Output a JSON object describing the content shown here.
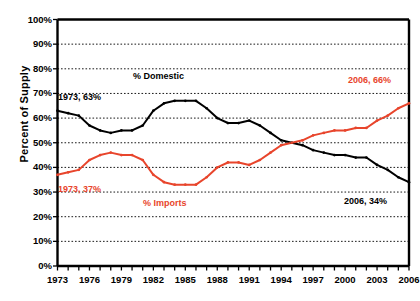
{
  "chart_data": {
    "type": "line",
    "title": "",
    "xlabel": "",
    "ylabel": "Percent of Supply",
    "ylim": [
      0,
      100
    ],
    "xlim": [
      1973,
      2006
    ],
    "grid": true,
    "legend_position": "inline-annotations",
    "ytick_labels": [
      "100%",
      "90%",
      "80%",
      "70%",
      "60%",
      "50%",
      "40%",
      "30%",
      "20%",
      "10%",
      "0%"
    ],
    "ytick_values": [
      100,
      90,
      80,
      70,
      60,
      50,
      40,
      30,
      20,
      10,
      0
    ],
    "xtick_labels": [
      "1973",
      "1976",
      "1979",
      "1982",
      "1985",
      "1988",
      "1991",
      "1994",
      "1997",
      "2000",
      "2003",
      "2006"
    ],
    "xtick_values": [
      1973,
      1976,
      1979,
      1982,
      1985,
      1988,
      1991,
      1994,
      1997,
      2000,
      2003,
      2006
    ],
    "x": [
      1973,
      1974,
      1975,
      1976,
      1977,
      1978,
      1979,
      1980,
      1981,
      1982,
      1983,
      1984,
      1985,
      1986,
      1987,
      1988,
      1989,
      1990,
      1991,
      1992,
      1993,
      1994,
      1995,
      1996,
      1997,
      1998,
      1999,
      2000,
      2001,
      2002,
      2003,
      2004,
      2005,
      2006
    ],
    "series": [
      {
        "name": "% Domestic",
        "color": "#000000",
        "values": [
          63,
          62,
          61,
          57,
          55,
          54,
          55,
          55,
          57,
          63,
          66,
          67,
          67,
          67,
          64,
          60,
          58,
          58,
          59,
          57,
          54,
          51,
          50,
          49,
          47,
          46,
          45,
          45,
          44,
          44,
          41,
          39,
          36,
          34
        ]
      },
      {
        "name": "% Imports",
        "color": "#e8452c",
        "values": [
          37,
          38,
          39,
          43,
          45,
          46,
          45,
          45,
          43,
          37,
          34,
          33,
          33,
          33,
          36,
          40,
          42,
          42,
          41,
          43,
          46,
          49,
          50,
          51,
          53,
          54,
          55,
          55,
          56,
          56,
          59,
          61,
          64,
          66
        ]
      }
    ],
    "annotations": [
      {
        "name": "domestic-start-label",
        "text": "1973, 63%",
        "color": "#000000",
        "left": 58,
        "top": 92
      },
      {
        "name": "domestic-series-label",
        "text": "% Domestic",
        "color": "#000000",
        "left": 133,
        "top": 71
      },
      {
        "name": "domestic-end-label",
        "text": "2006, 34%",
        "color": "#000000",
        "left": 344,
        "top": 196
      },
      {
        "name": "imports-start-label",
        "text": "1973, 37%",
        "color": "#e8452c",
        "left": 58,
        "top": 184
      },
      {
        "name": "imports-series-label",
        "text": "% Imports",
        "color": "#e8452c",
        "left": 143,
        "top": 198
      },
      {
        "name": "imports-end-label",
        "text": "2006, 66%",
        "color": "#e8452c",
        "left": 348,
        "top": 75
      }
    ]
  }
}
